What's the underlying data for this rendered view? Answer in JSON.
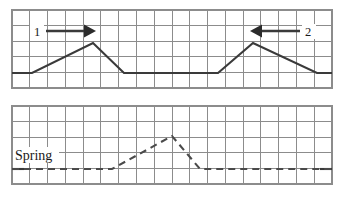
{
  "figure": {
    "width": 344,
    "height": 201,
    "background": "#ffffff",
    "grid_color": "#8c8c8c",
    "trace_color": "#3a3a3a",
    "label_color": "#1a1a1a"
  },
  "panels": [
    {
      "id": "upper-panel",
      "name": "upper-waveform-panel",
      "x": 12,
      "y": 10,
      "width": 320,
      "height": 78,
      "columns": 18,
      "rows": 5,
      "baseline_row": 4,
      "line_style": "solid",
      "callouts": [
        {
          "label": "1",
          "label_x": 36,
          "label_y": 35,
          "arrow_from_x": 46,
          "arrow_to_x": 94,
          "arrow_y": 31,
          "direction": "right"
        },
        {
          "label": "2",
          "label_x": 308,
          "label_y": 35,
          "arrow_from_x": 298,
          "arrow_to_x": 252,
          "arrow_y": 31,
          "direction": "left"
        }
      ]
    },
    {
      "id": "lower-panel",
      "name": "lower-waveform-panel",
      "x": 12,
      "y": 106,
      "width": 320,
      "height": 78,
      "columns": 18,
      "rows": 5,
      "baseline_row": 4,
      "line_style": "dashed",
      "callouts": []
    }
  ],
  "series": [
    {
      "name": "upper-trace",
      "style": "solid",
      "points": [
        {
          "x": 12,
          "y": 73
        },
        {
          "x": 32,
          "y": 73
        },
        {
          "x": 93,
          "y": 43
        },
        {
          "x": 124,
          "y": 73
        },
        {
          "x": 218,
          "y": 73
        },
        {
          "x": 253,
          "y": 43
        },
        {
          "x": 317,
          "y": 73
        },
        {
          "x": 332,
          "y": 73
        }
      ]
    },
    {
      "name": "lower-trace-spring",
      "style": "dashed",
      "label": "Spring",
      "label_x": 16,
      "label_y": 159,
      "points": [
        {
          "x": 12,
          "y": 169
        },
        {
          "x": 112,
          "y": 169
        },
        {
          "x": 172,
          "y": 136
        },
        {
          "x": 200,
          "y": 169
        },
        {
          "x": 332,
          "y": 169
        }
      ]
    }
  ],
  "labels": {
    "callout_one": "1",
    "callout_two": "2",
    "spring": "Spring"
  }
}
